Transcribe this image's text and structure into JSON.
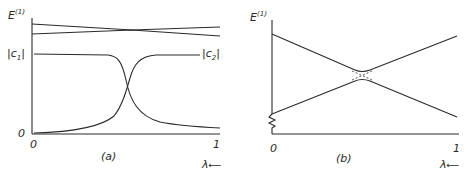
{
  "panels": [
    {
      "id": "a",
      "caption": "(a)",
      "y_label_top": "E",
      "y_label_top_sup": "(1)",
      "y_label_mid_left": "|c",
      "y_label_mid_left_sub": "1",
      "y_label_mid_left_end": "|",
      "y_label_mid_right": "|c",
      "y_label_mid_right_sub": "2",
      "y_label_mid_right_end": "|",
      "y_zero": "0",
      "x_ticks": [
        "0",
        "1"
      ],
      "x_label": "λ",
      "x_arrow": "⟵"
    },
    {
      "id": "b",
      "caption": "(b)",
      "y_label_top": "E",
      "y_label_top_sup": "(1)",
      "x_ticks": [
        "0",
        "1"
      ],
      "x_label": "λ",
      "x_arrow": "⟵"
    }
  ],
  "colors": {
    "ink": "#2a2a2a",
    "background": "#ffffff"
  }
}
